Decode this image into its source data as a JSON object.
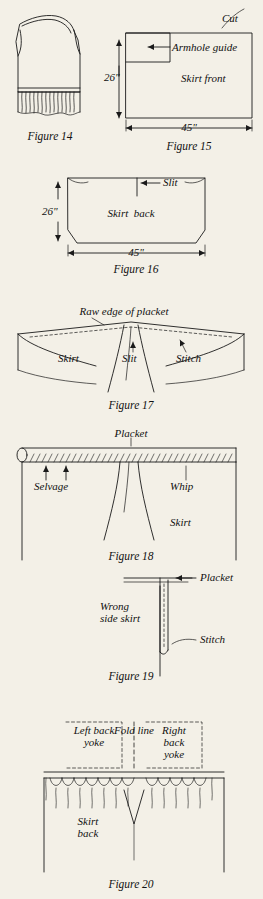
{
  "page": {
    "background_color": "#f3f0e7",
    "ink_color": "#1a1a1a"
  },
  "figures": [
    {
      "id": "figure-14",
      "caption": "Figure 14",
      "labels": []
    },
    {
      "id": "figure-15",
      "caption": "Figure 15",
      "labels": [
        {
          "name": "cut",
          "text": "Cut"
        },
        {
          "name": "armhole-guide",
          "text": "Armhole guide"
        },
        {
          "name": "skirt-front",
          "text": "Skirt front"
        }
      ],
      "dimensions": [
        {
          "name": "height",
          "text": "26\""
        },
        {
          "name": "width",
          "text": "45\""
        }
      ]
    },
    {
      "id": "figure-16",
      "caption": "Figure 16",
      "labels": [
        {
          "name": "slit",
          "text": "Slit"
        },
        {
          "name": "skirt-back",
          "text": "Skirt  back"
        }
      ],
      "dimensions": [
        {
          "name": "height",
          "text": "26\""
        },
        {
          "name": "width",
          "text": "45\""
        }
      ]
    },
    {
      "id": "figure-17",
      "caption": "Figure 17",
      "labels": [
        {
          "name": "raw-edge-of-placket",
          "text": "Raw edge of placket"
        },
        {
          "name": "skirt",
          "text": "Skirt"
        },
        {
          "name": "slit",
          "text": "Slit"
        },
        {
          "name": "stitch",
          "text": "Stitch"
        }
      ]
    },
    {
      "id": "figure-18",
      "caption": "Figure 18",
      "labels": [
        {
          "name": "placket",
          "text": "Placket"
        },
        {
          "name": "selvage",
          "text": "Selvage"
        },
        {
          "name": "whip",
          "text": "Whip"
        },
        {
          "name": "skirt",
          "text": "Skirt"
        }
      ]
    },
    {
      "id": "figure-19",
      "caption": "Figure 19",
      "labels": [
        {
          "name": "placket",
          "text": "Placket"
        },
        {
          "name": "wrong-side-skirt",
          "text": "Wrong\nside skirt"
        },
        {
          "name": "stitch",
          "text": "Stitch"
        }
      ]
    },
    {
      "id": "figure-20",
      "caption": "Figure 20",
      "labels": [
        {
          "name": "left-back-yoke",
          "text": "Left back\nyoke"
        },
        {
          "name": "fold-line",
          "text": "Fold line"
        },
        {
          "name": "right-back-yoke",
          "text": "Right\nback\nyoke"
        },
        {
          "name": "skirt-back",
          "text": "Skirt\nback"
        }
      ]
    }
  ]
}
